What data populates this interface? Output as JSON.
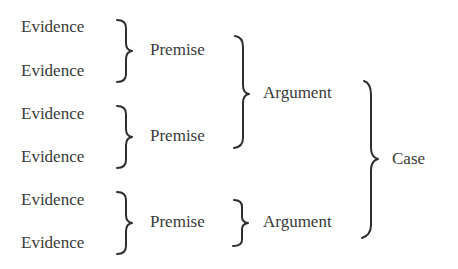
{
  "diagram": {
    "evidence": [
      {
        "label": "Evidence"
      },
      {
        "label": "Evidence"
      },
      {
        "label": "Evidence"
      },
      {
        "label": "Evidence"
      },
      {
        "label": "Evidence"
      },
      {
        "label": "Evidence"
      }
    ],
    "premises": [
      {
        "label": "Premise"
      },
      {
        "label": "Premise"
      },
      {
        "label": "Premise"
      }
    ],
    "arguments": [
      {
        "label": "Argument"
      },
      {
        "label": "Argument"
      }
    ],
    "case": {
      "label": "Case"
    },
    "structure": [
      {
        "from": [
          "Evidence 1",
          "Evidence 2"
        ],
        "to": "Premise 1"
      },
      {
        "from": [
          "Evidence 3",
          "Evidence 4"
        ],
        "to": "Premise 2"
      },
      {
        "from": [
          "Evidence 5",
          "Evidence 6"
        ],
        "to": "Premise 3"
      },
      {
        "from": [
          "Premise 1",
          "Premise 2"
        ],
        "to": "Argument 1"
      },
      {
        "from": [
          "Premise 3"
        ],
        "to": "Argument 2"
      },
      {
        "from": [
          "Argument 1",
          "Argument 2"
        ],
        "to": "Case"
      }
    ]
  }
}
